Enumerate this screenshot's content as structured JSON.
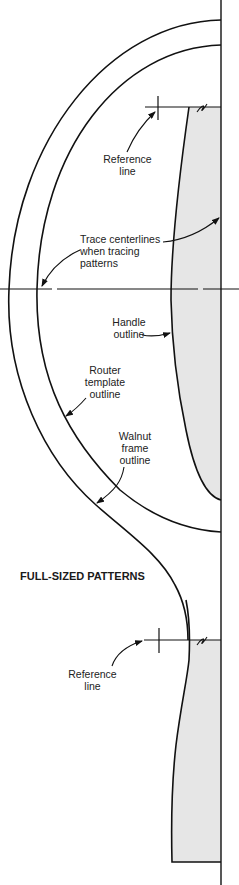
{
  "title": "FULL-SIZED PATTERNS",
  "colors": {
    "line": "#111111",
    "handle_fill": "#e6e6e6",
    "background": "#ffffff"
  },
  "labels": {
    "reference_line_top": "Reference\nline",
    "trace_centerlines": "Trace centerlines\nwhen tracing\npatterns",
    "handle_outline": "Handle\noutline",
    "router_template_outline": "Router\ntemplate\noutline",
    "walnut_frame_outline": "Walnut\nframe\noutline",
    "reference_line_bottom": "Reference\nline"
  },
  "parts": [
    {
      "name": "walnut-frame-outline",
      "type": "outer curve"
    },
    {
      "name": "router-template-outline",
      "type": "inner curve"
    },
    {
      "name": "handle-outline",
      "type": "shaded handle"
    },
    {
      "name": "centerline-vertical",
      "type": "line"
    },
    {
      "name": "centerline-horizontal",
      "type": "line"
    },
    {
      "name": "reference-line-top",
      "type": "line"
    },
    {
      "name": "reference-line-bottom",
      "type": "line"
    }
  ]
}
